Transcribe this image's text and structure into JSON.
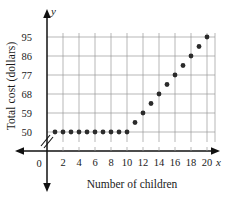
{
  "chart_data": {
    "type": "scatter",
    "title": "",
    "xlabel": "Number of children",
    "ylabel": "Total cost (dollars)",
    "x": [
      1,
      2,
      3,
      4,
      5,
      6,
      7,
      8,
      9,
      10,
      11,
      12,
      13,
      14,
      15,
      16,
      17,
      18,
      19,
      20
    ],
    "values": [
      50,
      50,
      50,
      50,
      50,
      50,
      50,
      50,
      50,
      50,
      54.5,
      59,
      63.5,
      68,
      72.5,
      77,
      81.5,
      86,
      90.5,
      95
    ],
    "xtick_labels": [
      "0",
      "2",
      "4",
      "6",
      "8",
      "10",
      "12",
      "14",
      "16",
      "18",
      "20"
    ],
    "xtick_values": [
      0,
      2,
      4,
      6,
      8,
      10,
      12,
      14,
      16,
      18,
      20
    ],
    "ytick_labels": [
      "50",
      "59",
      "68",
      "77",
      "86",
      "95"
    ],
    "ytick_values": [
      50,
      59,
      68,
      77,
      86,
      95
    ],
    "xlim": [
      0,
      21
    ],
    "ylim": [
      50,
      95
    ],
    "grid": true,
    "legend": null,
    "axis_letters": {
      "x": "x",
      "y": "y"
    },
    "origin_label": "0",
    "y_axis_break": true,
    "point_color": "#2b2b2b",
    "grid_color": "#9a9a9a",
    "axis_color": "#111111"
  }
}
